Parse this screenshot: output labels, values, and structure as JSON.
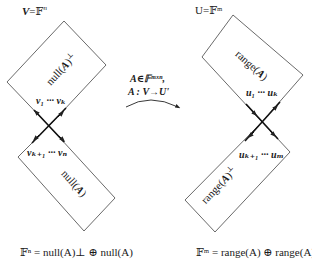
{
  "left": {
    "space_label": "V=𝔽ⁿ",
    "space_var": "V",
    "space_field": "𝔽",
    "space_exp": "n",
    "upper_region_label": "null(A)",
    "upper_region_perp": "⊥",
    "upper_vectors": "v₁ ··· vₖ",
    "lower_vectors": "vₖ₊₁ ··· vₙ",
    "lower_region_label": "null(A)",
    "decomposition": "𝔽ⁿ = null(A)⊥ ⊕ null(A)"
  },
  "center": {
    "line1": "A∈𝔽ᵐˣⁿ,",
    "line2": "A : V→U'",
    "arrow": "curved-arrow"
  },
  "right": {
    "space_label": "U=𝔽ᵐ",
    "upper_region_label": "range(A)",
    "upper_vectors": "u₁ ··· uₖ",
    "lower_vectors": "uₖ₊₁ ··· uₘ",
    "lower_region_label": "range(A)⊥",
    "decomposition": "𝔽ᵐ = range(A) ⊕ range(A)⊥"
  },
  "colors": {
    "stroke": "#333333",
    "text": "#1a1a1a",
    "background": "#ffffff"
  }
}
